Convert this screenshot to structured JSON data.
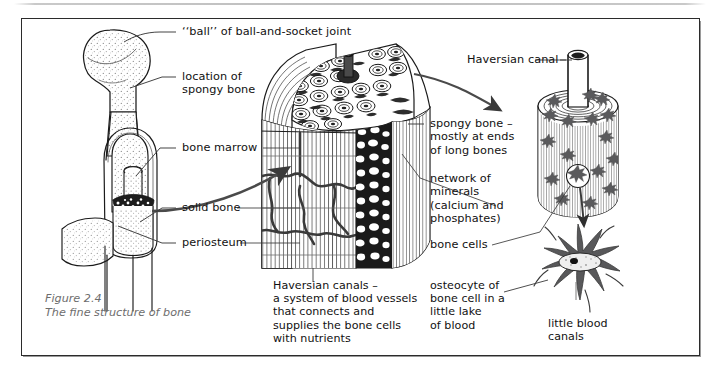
{
  "figure": {
    "number": "Figure 2.4",
    "title": "The fine structure of bone"
  },
  "labels": {
    "ball_joint": "‘‘ball’’ of ball-and-socket joint",
    "spongy_location": "location of\nspongy bone",
    "bone_marrow": "bone marrow",
    "solid_bone": "solid bone",
    "periosteum": "periosteum",
    "haversian_canal": "Haversian canal",
    "spongy_bone_ends": "spongy bone –\nmostly at ends\nof long bones",
    "network_minerals": "network of\nminerals\n(calcium and\nphosphates)",
    "bone_cells": "bone cells",
    "haversian_canals_note": "Haversian canals –\na system of blood vessels\nthat connects and\nsupplies the bone cells\nwith nutrients",
    "osteocyte_note": "osteocyte of\nbone cell in a\nlittle lake\nof blood",
    "little_blood_canals": "little blood\ncanals"
  },
  "diagrams": {
    "femur": "femur-bone-cutaway-illustration",
    "bone_block": "magnified-bone-block-cross-section",
    "haversian_cylinder": "haversian-system-cylinder",
    "osteocyte": "osteocyte-star-cell-detail"
  },
  "colors": {
    "ink": "#111111",
    "frame": "#2b2b2b",
    "caption": "#6d6d6d",
    "cell_fill": "#58585a",
    "rule": "#bdbdbd"
  }
}
